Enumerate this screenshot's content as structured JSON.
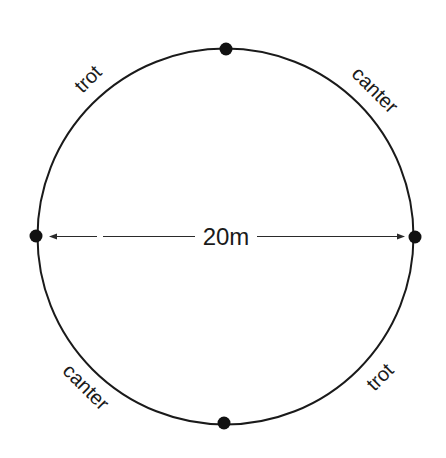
{
  "diagram": {
    "circle": {
      "cx": 225.5,
      "cy": 236.5,
      "r": 188,
      "stroke": "#1a1a1a"
    },
    "points": [
      {
        "name": "top",
        "x": 226,
        "y": 49
      },
      {
        "name": "right",
        "x": 415,
        "y": 237
      },
      {
        "name": "bottom",
        "x": 224,
        "y": 423
      },
      {
        "name": "left",
        "x": 36,
        "y": 236
      }
    ],
    "diameter_label": "20m",
    "segments": [
      {
        "position": "top-left",
        "label": "trot"
      },
      {
        "position": "top-right",
        "label": "canter"
      },
      {
        "position": "bottom-left",
        "label": "canter"
      },
      {
        "position": "bottom-right",
        "label": "trot"
      }
    ]
  }
}
